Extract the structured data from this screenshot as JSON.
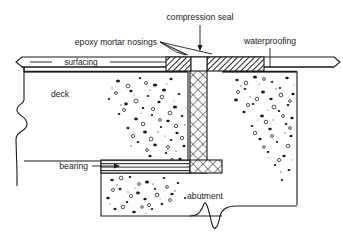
{
  "figure": {
    "background_color": "#ffffff",
    "line_color": "#1a1a1a"
  },
  "labels": {
    "compression_seal": "compression seal",
    "epoxy_mortar_nosings": "epoxy mortar nosings",
    "waterproofing": "waterproofing",
    "surfacing": "surfacing",
    "deck": "deck",
    "bearing": "bearing",
    "abutment": "abutment"
  },
  "components": [
    {
      "name": "surfacing-layer",
      "label": "surfacing",
      "hatch": "none"
    },
    {
      "name": "epoxy-mortar-nosing-left",
      "label": "epoxy mortar nosings",
      "hatch": "diagonal"
    },
    {
      "name": "epoxy-mortar-nosing-right",
      "label": "epoxy mortar nosings",
      "hatch": "diagonal"
    },
    {
      "name": "compression-seal",
      "label": "compression seal",
      "hatch": "none"
    },
    {
      "name": "joint-filler",
      "label": "joint",
      "hatch": "cross"
    },
    {
      "name": "deck-concrete",
      "label": "deck",
      "hatch": "stipple"
    },
    {
      "name": "abutment-concrete",
      "label": "abutment",
      "hatch": "stipple"
    },
    {
      "name": "bearing-block",
      "label": "bearing",
      "hatch": "horizontal-lines"
    },
    {
      "name": "waterproofing-layer",
      "label": "waterproofing",
      "hatch": "none"
    }
  ]
}
